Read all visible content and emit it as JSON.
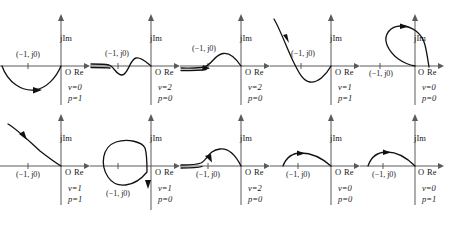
{
  "figure": {
    "rows": 2,
    "columns": 5,
    "axis_labels": {
      "imaginary": "jIm",
      "real": "Re",
      "origin": "O",
      "critical_point": "(−1, j0)"
    },
    "colors": {
      "curve": "#111111",
      "axis": "#5a5a5a",
      "text": "#1a1a1a",
      "background": "#ffffff"
    }
  },
  "panels": [
    {
      "id": "panel-1",
      "row": 1,
      "col": 1,
      "imaginary_label": "jIm",
      "real_label": "Re",
      "origin_label": "O",
      "point_label": "(−1, j0)",
      "v_label": "v=0",
      "p_label": "p=1",
      "v_value": 0,
      "p_value": 1,
      "shape": "dip-below-axis-from-left",
      "point_label_position": "above-axis"
    },
    {
      "id": "panel-2",
      "row": 1,
      "col": 2,
      "imaginary_label": "jIm",
      "real_label": "Re",
      "origin_label": "O",
      "point_label": "(−1, j0)",
      "v_label": "v=2",
      "p_label": "p=0",
      "v_value": 2,
      "p_value": 0,
      "shape": "s-wave-dip-then-hump",
      "point_label_position": "above-axis"
    },
    {
      "id": "panel-3",
      "row": 1,
      "col": 3,
      "imaginary_label": "jIm",
      "real_label": "Re",
      "origin_label": "O",
      "point_label": "(−1, j0)",
      "v_label": "v=2",
      "p_label": "p=0",
      "v_value": 2,
      "p_value": 0,
      "shape": "flat-then-hump-above-axis",
      "point_label_position": "above-axis"
    },
    {
      "id": "panel-4",
      "row": 1,
      "col": 4,
      "imaginary_label": "jIm",
      "real_label": "Re",
      "origin_label": "O",
      "point_label": "(−1, j0)",
      "v_label": "v=1",
      "p_label": "p=1",
      "v_value": 1,
      "p_value": 1,
      "shape": "steep-descend-from-upper-left-then-dip",
      "point_label_position": "above-axis"
    },
    {
      "id": "panel-5",
      "row": 1,
      "col": 5,
      "imaginary_label": "jIm",
      "real_label": "Re",
      "origin_label": "O",
      "point_label": "(−1, j0)",
      "v_label": "v=0",
      "p_label": "p=0",
      "v_value": 0,
      "p_value": 0,
      "shape": "loop-above-axis-crossing-right",
      "point_label_position": "below-axis"
    },
    {
      "id": "panel-6",
      "row": 2,
      "col": 1,
      "imaginary_label": "jIm",
      "real_label": "Re",
      "origin_label": "O",
      "point_label": "(−1, j0)",
      "v_label": "v=1",
      "p_label": "p=1",
      "v_value": 1,
      "p_value": 1,
      "shape": "monotonic-descend-to-origin",
      "point_label_position": "below-axis"
    },
    {
      "id": "panel-7",
      "row": 2,
      "col": 2,
      "imaginary_label": "jIm",
      "real_label": "Re",
      "origin_label": "O",
      "point_label": "(−1, j0)",
      "v_label": "v=1",
      "p_label": "p=0",
      "v_value": 1,
      "p_value": 0,
      "shape": "closed-loop-encircling-critical-point",
      "point_label_position": "below-axis"
    },
    {
      "id": "panel-8",
      "row": 2,
      "col": 3,
      "imaginary_label": "jIm",
      "real_label": "Re",
      "origin_label": "O",
      "point_label": "(−1, j0)",
      "v_label": "v=2",
      "p_label": "p=0",
      "v_value": 2,
      "p_value": 0,
      "shape": "flat-then-hump-above-axis",
      "point_label_position": "below-axis"
    },
    {
      "id": "panel-9",
      "row": 2,
      "col": 4,
      "imaginary_label": "jIm",
      "real_label": "Re",
      "origin_label": "O",
      "point_label": "(−1, j0)",
      "v_label": "v=0",
      "p_label": "p=0",
      "v_value": 0,
      "p_value": 0,
      "shape": "small-arc-above-axis",
      "point_label_position": "below-axis"
    },
    {
      "id": "panel-10",
      "row": 2,
      "col": 5,
      "imaginary_label": "jIm",
      "real_label": "Re",
      "origin_label": "O",
      "point_label": "(−1, j0)",
      "v_label": "v=0",
      "p_label": "p=1",
      "v_value": 0,
      "p_value": 1,
      "shape": "small-arc-above-axis",
      "point_label_position": "below-axis"
    }
  ]
}
